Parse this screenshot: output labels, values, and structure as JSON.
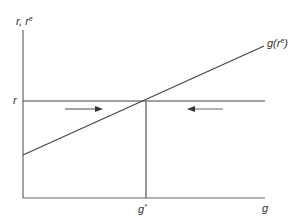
{
  "diagram": {
    "type": "economic-equilibrium",
    "y_axis_label": {
      "base": "r, r",
      "sup": "e"
    },
    "x_axis_label": "g",
    "r_level_label": "r",
    "equilibrium_label": {
      "base": "g",
      "sup": "*"
    },
    "curve_label": {
      "prefix": "g(r",
      "sup": "e",
      "suffix": ")"
    },
    "arrows": [
      {
        "name": "right-arrow",
        "direction": "right",
        "meaning": "adjustment toward g* from below"
      },
      {
        "name": "left-arrow",
        "direction": "left",
        "meaning": "adjustment toward g* from above"
      }
    ],
    "colors": {
      "line": "#555555",
      "text": "#333333",
      "background": "#ffffff"
    }
  }
}
